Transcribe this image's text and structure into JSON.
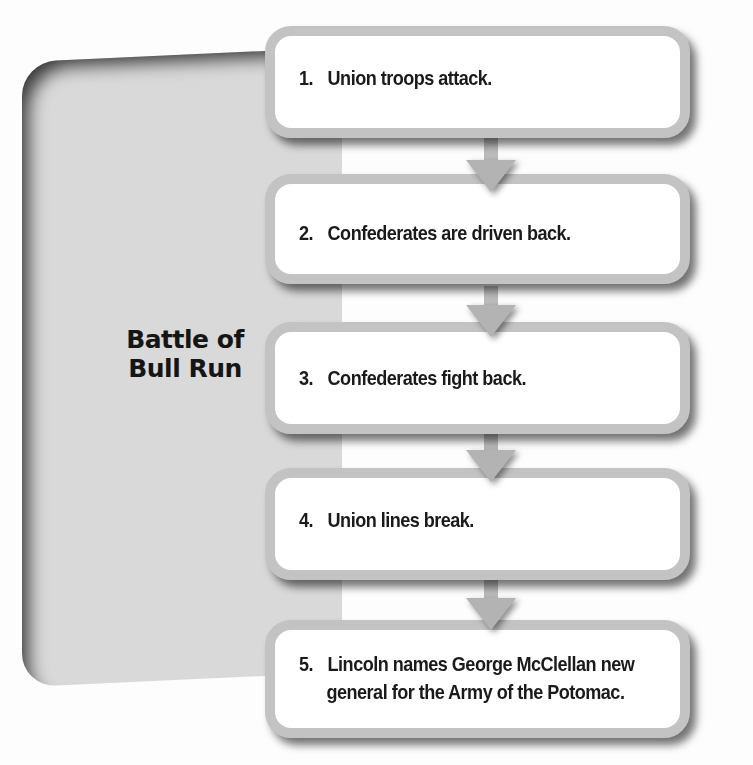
{
  "diagram": {
    "type": "flowchart",
    "topic": "Battle of Bull Run",
    "steps": [
      {
        "number": "1.",
        "text": "Union troops attack."
      },
      {
        "number": "2.",
        "text": "Confederates are driven back."
      },
      {
        "number": "3.",
        "text": "Confederates fight back."
      },
      {
        "number": "4.",
        "text": "Union lines break."
      },
      {
        "number": "5.",
        "text": "Lincoln names George McClellan new",
        "text2": "general for the Army of the Potomac."
      }
    ],
    "colors": {
      "panel": "#d9d9d9",
      "box_border": "#c3c3c3",
      "box_fill": "#ffffff",
      "arrow": "#b3b3b3",
      "text": "#1a1a1a"
    }
  }
}
